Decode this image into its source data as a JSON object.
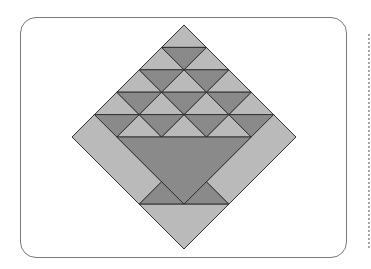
{
  "colors": {
    "light": "#bababa",
    "dark": "#8a8a8a",
    "stroke": "#2a2a2a",
    "card_border": "#7a7a7a",
    "dotted_rule": "#a6a6a6"
  },
  "block": {
    "shape": "diamond",
    "center": [
      184,
      137
    ],
    "half_size": 112,
    "grid_unit": 22.4,
    "triangle_rows": 5,
    "pieces": {
      "light_triangles_rows": [
        1,
        2,
        3,
        4,
        3
      ],
      "dark_triangles_rows": [
        0,
        1,
        2,
        3,
        4
      ],
      "basket_body": "large dark inverted triangle",
      "basket_feet": 2,
      "side_strips": 2,
      "bottom_triangle": "light"
    }
  }
}
